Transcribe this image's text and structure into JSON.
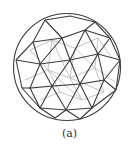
{
  "figure": {
    "caption": "(a)",
    "colors": {
      "front_edges": "#3a3a3a",
      "back_edges": "#b8b8b8",
      "background": "#ffffff"
    }
  }
}
